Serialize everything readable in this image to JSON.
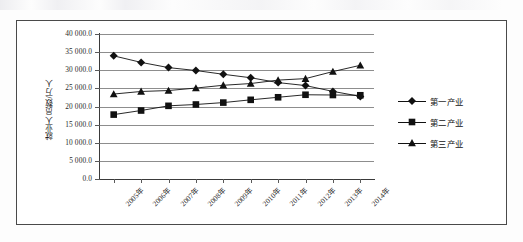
{
  "chart_data": {
    "type": "line",
    "title": "",
    "subtitle": "",
    "xlabel": "",
    "ylabel": "就业人员数/万人",
    "categories": [
      "2005年",
      "2006年",
      "2007年",
      "2008年",
      "2009年",
      "2010年",
      "2011年",
      "2012年",
      "2013年",
      "2014年"
    ],
    "ylim": [
      0,
      40000
    ],
    "ytick_labels": [
      "0.0",
      "5 000.0",
      "10 000.0",
      "15 000.0",
      "20 000.0",
      "25 000.0",
      "30 000.0",
      "35 000.0",
      "40 000.0"
    ],
    "ytick_values": [
      0,
      5000,
      10000,
      15000,
      20000,
      25000,
      30000,
      35000,
      40000
    ],
    "grid": true,
    "legend_position": "right",
    "series": [
      {
        "name": "第一产业",
        "marker": "diamond",
        "color": "#111111",
        "values": [
          33970,
          32172,
          30731,
          29923,
          28890,
          27931,
          26594,
          25773,
          24171,
          22790
        ]
      },
      {
        "name": "第二产业",
        "marker": "square",
        "color": "#111111",
        "values": [
          17766,
          18894,
          20186,
          20553,
          21080,
          21842,
          22544,
          23241,
          23170,
          23099
        ]
      },
      {
        "name": "第三产业",
        "marker": "triangle",
        "color": "#111111",
        "values": [
          23439,
          24143,
          24404,
          25087,
          25857,
          26332,
          27282,
          27690,
          29636,
          31364
        ]
      }
    ]
  },
  "legend": {
    "entries": [
      {
        "label": "第一产业",
        "marker": "diamond"
      },
      {
        "label": "第二产业",
        "marker": "square"
      },
      {
        "label": "第三产业",
        "marker": "triangle"
      }
    ]
  }
}
